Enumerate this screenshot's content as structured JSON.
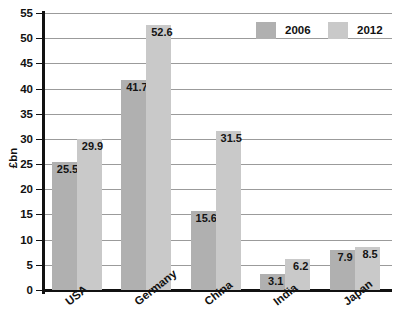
{
  "chart_data": {
    "type": "bar",
    "title": "",
    "subtitle": "",
    "xlabel": "",
    "ylabel": "£bn",
    "ylim": [
      0,
      55
    ],
    "ytick_labels": [
      "0",
      "5",
      "10",
      "15",
      "20",
      "25",
      "30",
      "35",
      "40",
      "45",
      "50",
      "55"
    ],
    "ytick_values": [
      0,
      5,
      10,
      15,
      20,
      25,
      30,
      35,
      40,
      45,
      50,
      55
    ],
    "grid": true,
    "grid_axis": "y",
    "legend_position": "top-right",
    "categories": [
      "USA",
      "Germany",
      "China",
      "India",
      "Japan"
    ],
    "series": [
      {
        "name": "2006",
        "color": "#b0b0b0",
        "values": [
          25.5,
          41.7,
          15.6,
          3.1,
          7.9
        ],
        "labels": [
          "25.5",
          "41.7",
          "15.6",
          "3.1",
          "7.9"
        ]
      },
      {
        "name": "2012",
        "color": "#c9c9c9",
        "values": [
          29.9,
          52.6,
          31.5,
          6.2,
          8.5
        ],
        "labels": [
          "29.9",
          "52.6",
          "31.5",
          "6.2",
          "8.5"
        ]
      }
    ]
  },
  "legend": {
    "entries": [
      {
        "label": "2006",
        "color": "#b0b0b0"
      },
      {
        "label": "2012",
        "color": "#c9c9c9"
      }
    ]
  },
  "axes": {
    "y_title": "£bn",
    "axis_color": "#111111",
    "grid_color": "#9b9b9b"
  }
}
